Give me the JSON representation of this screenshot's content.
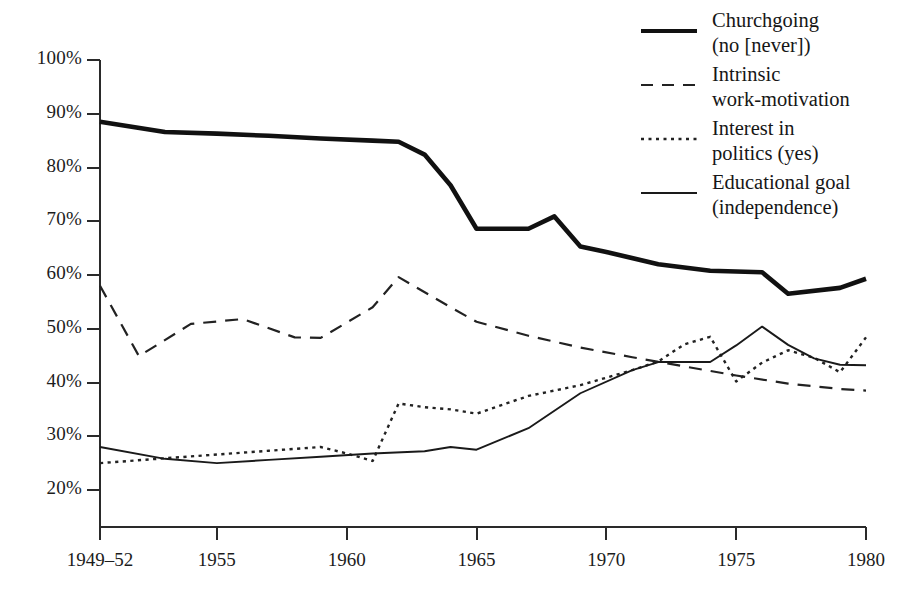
{
  "chart_data": {
    "type": "line",
    "title": "",
    "subtitle": "",
    "xlabel": "",
    "ylabel": "",
    "xlim": [
      1950.5,
      1980
    ],
    "ylim": [
      15,
      103
    ],
    "grid": false,
    "legend_position": "top-right",
    "y_ticks": [
      "20%",
      "30%",
      "40%",
      "50%",
      "60%",
      "70%",
      "80%",
      "90%",
      "100%"
    ],
    "y_tick_values": [
      20,
      30,
      40,
      50,
      60,
      70,
      80,
      90,
      100
    ],
    "x_ticks": [
      "1949–52",
      "1955",
      "1960",
      "1965",
      "1970",
      "1975",
      "1980"
    ],
    "x_tick_values": [
      1950.5,
      1955,
      1960,
      1965,
      1970,
      1975,
      1980
    ],
    "series": [
      {
        "name": "Churchgoing (no [never])",
        "legend_label": "Churchgoing\n(no [never])",
        "style": "solid-thick",
        "color": "#111111",
        "x": [
          1950.5,
          1953,
          1955,
          1957,
          1959,
          1961,
          1962,
          1963,
          1964,
          1965,
          1967,
          1968,
          1969,
          1970,
          1972,
          1974,
          1976,
          1977,
          1979,
          1980
        ],
        "values": [
          88.5,
          86.6,
          86.3,
          85.9,
          85.4,
          85.0,
          84.8,
          82.4,
          76.7,
          68.6,
          68.6,
          70.9,
          65.3,
          64.3,
          62.0,
          60.8,
          60.5,
          56.5,
          57.6,
          59.3
        ]
      },
      {
        "name": "Intrinsic work-motivation",
        "legend_label": "Intrinsic\nwork-motivation",
        "style": "dashed",
        "color": "#222222",
        "x": [
          1950.5,
          1952,
          1954,
          1956,
          1958,
          1959,
          1961,
          1962,
          1964,
          1965,
          1967,
          1969,
          1971,
          1973,
          1975,
          1977,
          1979,
          1980
        ],
        "values": [
          58.0,
          44.9,
          50.9,
          51.8,
          48.4,
          48.3,
          54.0,
          59.6,
          54.0,
          51.3,
          48.7,
          46.5,
          44.7,
          43.0,
          41.3,
          39.8,
          38.8,
          38.5
        ]
      },
      {
        "name": "Interest in politics (yes)",
        "legend_label": "Interest in\npolitics (yes)",
        "style": "dotted",
        "color": "#222222",
        "x": [
          1950.5,
          1953,
          1955,
          1957,
          1959,
          1960,
          1961,
          1962,
          1963,
          1964,
          1965,
          1967,
          1969,
          1971,
          1972,
          1973,
          1974,
          1975,
          1976,
          1977,
          1978,
          1979,
          1980
        ],
        "values": [
          25.0,
          25.9,
          26.6,
          27.3,
          28.0,
          26.8,
          25.4,
          36.1,
          35.4,
          35.0,
          34.2,
          37.5,
          39.5,
          42.3,
          43.9,
          47.1,
          48.5,
          40.2,
          43.7,
          46.0,
          44.6,
          41.9,
          48.4
        ]
      },
      {
        "name": "Educational goal (independence)",
        "legend_label": "Educational goal\n(independence)",
        "style": "solid-thin",
        "color": "#1a1a1a",
        "x": [
          1950.5,
          1953,
          1955,
          1957,
          1959,
          1961,
          1963,
          1964,
          1965,
          1967,
          1969,
          1971,
          1972,
          1973,
          1974,
          1975,
          1976,
          1977,
          1978,
          1979,
          1980
        ],
        "values": [
          28.0,
          25.8,
          25.0,
          25.6,
          26.2,
          26.8,
          27.2,
          28.0,
          27.5,
          31.5,
          38.0,
          42.3,
          43.8,
          43.8,
          43.8,
          46.9,
          50.4,
          47.0,
          44.5,
          43.3,
          43.2
        ]
      }
    ]
  },
  "axes": {
    "tick_color": "#2a2a2a",
    "axis_color": "#2a2a2a"
  }
}
